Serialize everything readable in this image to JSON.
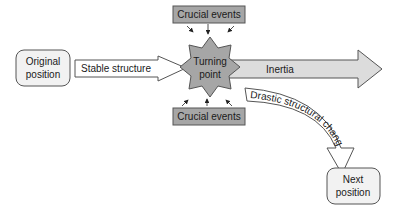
{
  "diagram": {
    "nodes": {
      "original": {
        "line1": "Original",
        "line2": "position"
      },
      "turning": {
        "line1": "Turning",
        "line2": "point"
      },
      "next": {
        "line1": "Next",
        "line2": "position"
      },
      "events_top": {
        "label": "Crucial events"
      },
      "events_bottom": {
        "label": "Crucial events"
      }
    },
    "arrows": {
      "stable": {
        "label": "Stable structure"
      },
      "inertia": {
        "label": "Inertia"
      },
      "drastic": {
        "label": "Drastic structural change"
      }
    },
    "colors": {
      "box_fill": "#f2f2f2",
      "star_fill": "#a6a6a6",
      "events_fill": "#a6a6a6",
      "inertia_fill": "#dcdcdc",
      "stroke": "#444444"
    }
  }
}
